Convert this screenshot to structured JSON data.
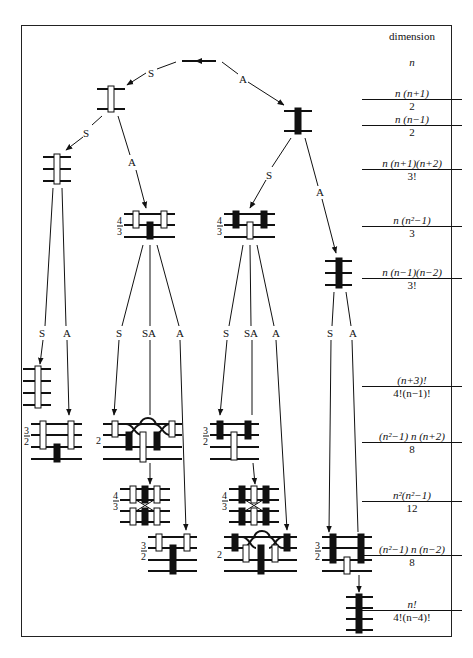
{
  "header": {
    "dimension_label": "dimension"
  },
  "edge_labels": {
    "S": "S",
    "A": "A",
    "SA": "SA"
  },
  "multiplicities": {
    "four_thirds_num": "4",
    "four_thirds_den": "3",
    "three_halves_num": "3",
    "three_halves_den": "2",
    "two": "2"
  },
  "dimensions": [
    {
      "id": "rank1",
      "single": "n"
    },
    {
      "id": "sym2",
      "num": "n (n+1)",
      "den": "2"
    },
    {
      "id": "asym2",
      "num": "n (n−1)",
      "den": "2"
    },
    {
      "id": "sym3",
      "num": "n (n+1)(n+2)",
      "den": "3!"
    },
    {
      "id": "mixed3",
      "num": "n (n²−1)",
      "den": "3"
    },
    {
      "id": "asym3",
      "num": "n (n−1)(n−2)",
      "den": "3!"
    },
    {
      "id": "sym4",
      "num": "(n+3)!",
      "den": "4!(n−1)!"
    },
    {
      "id": "mixed4a",
      "num": "(n²−1) n (n+2)",
      "den": "8"
    },
    {
      "id": "mixed4b",
      "num": "n²(n²−1)",
      "den": "12"
    },
    {
      "id": "mixed4c",
      "num": "(n²−1) n (n−2)",
      "den": "8"
    },
    {
      "id": "asym4",
      "num": "n!",
      "den": "4!(n−4)!"
    }
  ]
}
